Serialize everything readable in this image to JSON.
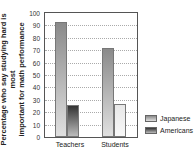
{
  "chart_data": {
    "type": "bar",
    "title": "",
    "xlabel": "",
    "ylabel": "Percentage who say studying hard is most important for math performance",
    "ylim": [
      0,
      100
    ],
    "yticks": [
      0,
      10,
      20,
      30,
      40,
      50,
      60,
      70,
      80,
      90,
      100
    ],
    "grid": true,
    "legend_position": "right-bottom",
    "categories": [
      "Teachers",
      "Students"
    ],
    "series": [
      {
        "name": "Japanese",
        "values": [
          93,
          72
        ]
      },
      {
        "name": "Americans",
        "values": [
          26,
          27
        ]
      }
    ]
  },
  "labels": {
    "ylabel_line1": "Percentage who say studying hard is most",
    "ylabel_line2": "important for math performance",
    "cat0": "Teachers",
    "cat1": "Students",
    "leg0": "Japanese",
    "leg1": "Americans"
  }
}
